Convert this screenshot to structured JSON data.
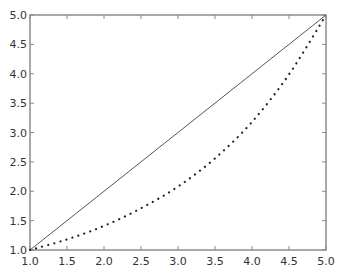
{
  "chart_data": {
    "type": "line",
    "title": "",
    "xlabel": "",
    "ylabel": "",
    "xlim": [
      1.0,
      5.0
    ],
    "ylim": [
      1.0,
      5.0
    ],
    "grid": false,
    "legend": null,
    "xticks": [
      "1.0",
      "1.5",
      "2.0",
      "2.5",
      "3.0",
      "3.5",
      "4.0",
      "4.5",
      "5.0"
    ],
    "yticks": [
      "1.0",
      "1.5",
      "2.0",
      "2.5",
      "3.0",
      "3.5",
      "4.0",
      "4.5",
      "5.0"
    ],
    "series": [
      {
        "name": "linear",
        "style": "solid",
        "color": "#555555",
        "x": [
          1.0,
          5.0
        ],
        "y": [
          1.0,
          5.0
        ]
      },
      {
        "name": "curve",
        "style": "dotted",
        "color": "#222222",
        "x": [
          1.0,
          1.5,
          2.0,
          2.5,
          3.0,
          3.5,
          4.0,
          4.5,
          5.0
        ],
        "y": [
          1.0,
          1.18,
          1.41,
          1.71,
          2.08,
          2.56,
          3.18,
          3.99,
          5.0
        ]
      }
    ]
  }
}
